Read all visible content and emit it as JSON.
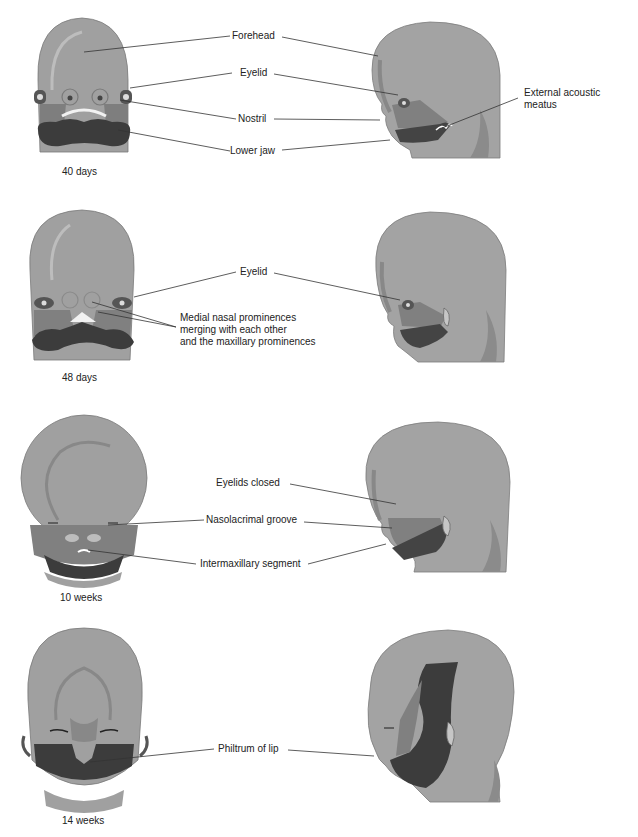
{
  "figure": {
    "colors": {
      "skin_light": "#a2a2a2",
      "skin_mid": "#8e8e8e",
      "skin_dark": "#6e6e6e",
      "jaw_dark": "#3a3a3a",
      "leader_line": "#333333",
      "text": "#222222",
      "background": "#ffffff"
    },
    "stages": [
      {
        "id": "40-days",
        "label": "40 days",
        "labels": [
          "Forehead",
          "Eyelid",
          "Nostril",
          "Lower jaw",
          "External acoustic meatus"
        ]
      },
      {
        "id": "48-days",
        "label": "48 days",
        "labels": [
          "Eyelid",
          "Medial nasal prominences merging with each other and the maxillary prominences"
        ]
      },
      {
        "id": "10-weeks",
        "label": "10 weeks",
        "labels": [
          "Eyelids closed",
          "Nasolacrimal groove",
          "Intermaxillary segment"
        ]
      },
      {
        "id": "14-weeks",
        "label": "14 weeks",
        "labels": [
          "Philtrum of lip"
        ]
      }
    ]
  },
  "labels": {
    "forehead": "Forehead",
    "eyelid_40": "Eyelid",
    "nostril": "Nostril",
    "lower_jaw": "Lower jaw",
    "ext_acoustic_1": "External acoustic",
    "ext_acoustic_2": "meatus",
    "eyelid_48": "Eyelid",
    "medial_1": "Medial nasal prominences",
    "medial_2": "merging with each other",
    "medial_3": "and the maxillary prominences",
    "eyelids_closed": "Eyelids closed",
    "nasolacrimal": "Nasolacrimal groove",
    "intermaxillary": "Intermaxillary segment",
    "philtrum": "Philtrum of lip"
  },
  "stage_labels": {
    "s1": "40 days",
    "s2": "48 days",
    "s3": "10 weeks",
    "s4": "14 weeks"
  }
}
